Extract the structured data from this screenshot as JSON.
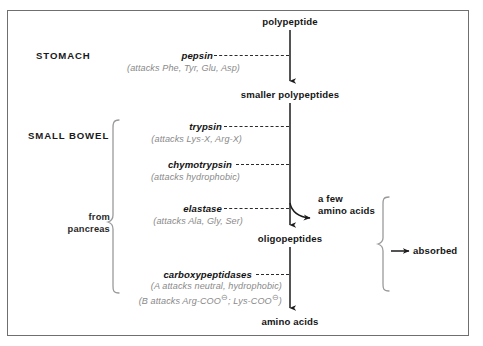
{
  "diagram": {
    "frame_color": "#6f6f6f",
    "accent_color": "#8a8a8a"
  },
  "regions": [
    {
      "id": "stomach",
      "label": "STOMACH"
    },
    {
      "id": "small_bowel",
      "label": "SMALL BOWEL"
    }
  ],
  "side_labels": [
    {
      "id": "pancreas",
      "line1": "from",
      "line2": "pancreas"
    }
  ],
  "nodes": [
    {
      "id": "polypeptide",
      "label": "polypeptide"
    },
    {
      "id": "smaller_polypeptides",
      "label": "smaller polypeptides"
    },
    {
      "id": "a_few_amino_acids_line1",
      "label": "a few"
    },
    {
      "id": "a_few_amino_acids_line2",
      "label": "amino acids"
    },
    {
      "id": "oligopeptides",
      "label": "oligopeptides"
    },
    {
      "id": "amino_acids",
      "label": "amino acids"
    },
    {
      "id": "absorbed",
      "label": "absorbed"
    }
  ],
  "enzymes": [
    {
      "id": "pepsin",
      "name": "pepsin",
      "attacks": [
        "(attacks Phe, Tyr, Glu, Asp)"
      ]
    },
    {
      "id": "trypsin",
      "name": "trypsin",
      "attacks": [
        "(attacks Lys-X, Arg-X)"
      ]
    },
    {
      "id": "chymotrypsin",
      "name": "chymotrypsin",
      "attacks": [
        "(attacks hydrophobic)"
      ]
    },
    {
      "id": "elastase",
      "name": "elastase",
      "attacks": [
        "(attacks Ala, Gly, Ser)"
      ]
    },
    {
      "id": "carboxypeptidases",
      "name": "carboxypeptidases",
      "attacks": [
        "(A attacks neutral, hydrophobic)"
      ],
      "attacks_b_prefix": "(B attacks Arg-COO",
      "attacks_b_mid": "; Lys-COO",
      "attacks_b_suffix": ")",
      "charge_glyph": "⊖"
    }
  ]
}
